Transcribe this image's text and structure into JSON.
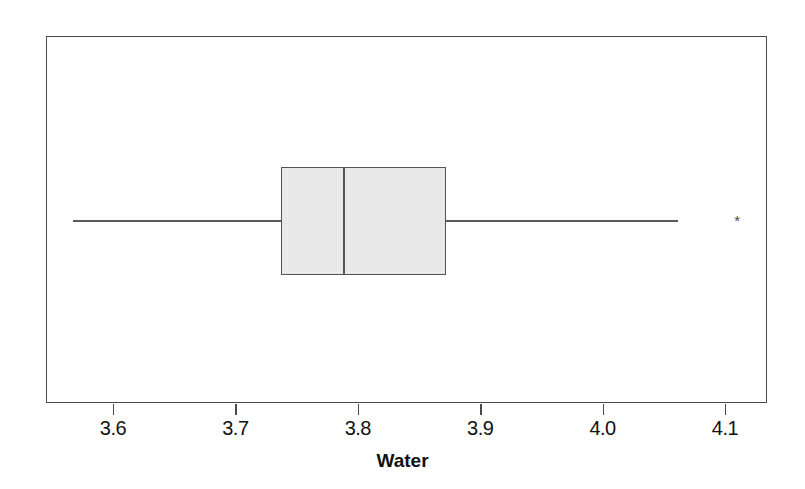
{
  "chart_data": {
    "type": "box",
    "title": "",
    "xlabel": "Water",
    "ylabel": "",
    "orientation": "horizontal",
    "xlim": [
      3.553,
      3.553
    ],
    "xlim_data_min": 3.553,
    "xlim_data_max": 4.142,
    "grid": false,
    "legend": null,
    "tick_labels": [
      "3.6",
      "3.7",
      "3.8",
      "3.9",
      "4.0",
      "4.1"
    ],
    "tick_values": [
      3.6,
      3.7,
      3.8,
      3.9,
      4.0,
      4.1
    ],
    "box_fill_color": "#f1f1f1",
    "box_line_color": "#555555",
    "frame_color": "#4a4a4a",
    "background_color": "#ffffff",
    "boxes": [
      {
        "name": "Water",
        "whisker_low": 3.567,
        "q1": 3.737,
        "median": 3.788,
        "q3": 3.872,
        "whisker_high": 4.062,
        "outliers": [
          4.11
        ],
        "outlier_marker": "asterisk"
      }
    ]
  },
  "axis": {
    "title": "Water",
    "ticks": [
      {
        "label": "3.6",
        "value": 3.6
      },
      {
        "label": "3.7",
        "value": 3.7
      },
      {
        "label": "3.8",
        "value": 3.8
      },
      {
        "label": "3.9",
        "value": 3.9
      },
      {
        "label": "4.0",
        "value": 4.0
      },
      {
        "label": "4.1",
        "value": 4.1
      }
    ]
  }
}
